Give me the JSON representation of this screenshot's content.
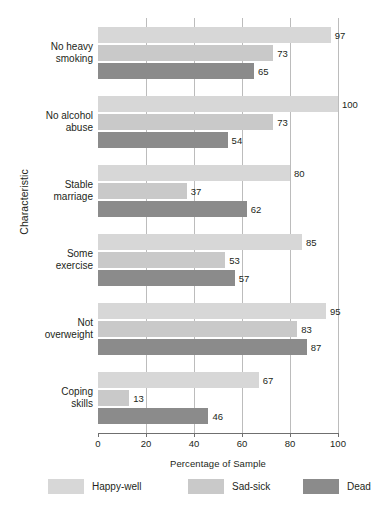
{
  "chart_data": {
    "type": "bar",
    "orientation": "horizontal",
    "title": "",
    "xlabel": "Percentage of Sample",
    "ylabel": "Characteristic",
    "xlim": [
      0,
      100
    ],
    "xticks": [
      0,
      20,
      40,
      60,
      80,
      100
    ],
    "grid": true,
    "legend_position": "bottom",
    "categories": [
      "No heavy smoking",
      "No alcohol abuse",
      "Stable marriage",
      "Some exercise",
      "Not overweight",
      "Coping skills"
    ],
    "category_lines": [
      [
        "No heavy",
        "smoking"
      ],
      [
        "No alcohol",
        "abuse"
      ],
      [
        "Stable",
        "marriage"
      ],
      [
        "Some",
        "exercise"
      ],
      [
        "Not",
        "overweight"
      ],
      [
        "Coping",
        "skills"
      ]
    ],
    "series": [
      {
        "name": "Happy-well",
        "color": "#d7d7d7",
        "values": [
          97,
          100,
          80,
          85,
          95,
          67
        ]
      },
      {
        "name": "Sad-sick",
        "color": "#c9c9c9",
        "values": [
          73,
          73,
          37,
          53,
          83,
          13
        ]
      },
      {
        "name": "Dead",
        "color": "#8b8b8b",
        "values": [
          65,
          54,
          62,
          57,
          87,
          46
        ]
      }
    ]
  },
  "axes": {
    "x_title": "Percentage of Sample",
    "y_title": "Characteristic",
    "tick_labels": [
      "0",
      "20",
      "40",
      "60",
      "80",
      "100"
    ]
  },
  "legend": {
    "items": [
      {
        "label": "Happy-well",
        "color": "#d7d7d7"
      },
      {
        "label": "Sad-sick",
        "color": "#c9c9c9"
      },
      {
        "label": "Dead",
        "color": "#8b8b8b"
      }
    ]
  }
}
